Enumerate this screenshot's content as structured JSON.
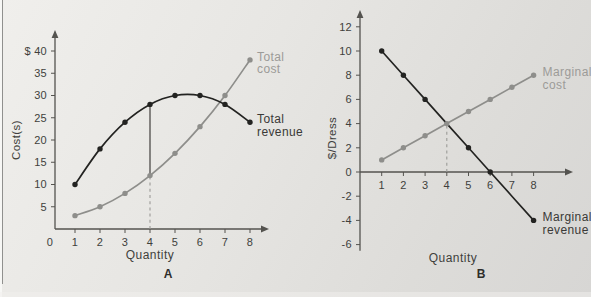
{
  "page": {
    "background_top": "#f0efec",
    "background_bottom": "#d7d6d4",
    "left_edge_line_color": "#90908e",
    "axis_color": "#54534f",
    "tick_text_color": "#403f3c"
  },
  "chart_data": [
    {
      "type": "line",
      "panel_label": "A",
      "xlabel": "Quantity",
      "ylabel": "Cost(s)",
      "x": [
        1,
        2,
        3,
        4,
        5,
        6,
        7,
        8
      ],
      "x_axis_ticks": [
        0,
        1,
        2,
        3,
        4,
        5,
        6,
        7,
        8
      ],
      "y_axis_ticks": [
        5,
        10,
        15,
        20,
        25,
        30,
        35,
        40
      ],
      "y_top_tick_label": "$ 40",
      "xlim": [
        0,
        8.6
      ],
      "ylim": [
        0,
        44
      ],
      "grid": false,
      "legend_position": "right-of-line-ends",
      "series": [
        {
          "name": "Total cost",
          "label_lines": [
            "Total",
            "cost"
          ],
          "values": [
            3,
            5,
            8,
            12,
            17,
            23,
            30,
            38
          ],
          "color": "#8e8e8b",
          "label_color": "#9c9b98",
          "smooth": true,
          "marker_skip": []
        },
        {
          "name": "Total revenue",
          "label_lines": [
            "Total",
            "revenue"
          ],
          "values": [
            10,
            18,
            24,
            28,
            30,
            30,
            28,
            24
          ],
          "color": "#232321",
          "label_color": "#3a3937",
          "smooth": true,
          "marker_skip": []
        }
      ],
      "guides": [
        {
          "x": 4,
          "y1": 12,
          "y2": 28,
          "style": "solid",
          "color": "#413f3c"
        },
        {
          "x": 4,
          "y1": 0,
          "y2": 12,
          "style": "dashed",
          "color": "#9b9a97"
        }
      ]
    },
    {
      "type": "line",
      "panel_label": "B",
      "xlabel": "Quantity",
      "ylabel": "$/Dress",
      "x": [
        1,
        2,
        3,
        4,
        5,
        6,
        7,
        8
      ],
      "x_axis_ticks": [
        1,
        2,
        3,
        4,
        5,
        6,
        7,
        8
      ],
      "y_axis_ticks": [
        -6,
        -4,
        -2,
        0,
        2,
        4,
        6,
        8,
        10,
        12
      ],
      "xlim": [
        0,
        9.7
      ],
      "ylim": [
        -6.5,
        13
      ],
      "grid": false,
      "legend_position": "right-of-line-ends",
      "series": [
        {
          "name": "Marginal cost",
          "label_lines": [
            "Marginal",
            "cost"
          ],
          "values": [
            1,
            2,
            3,
            4,
            5,
            6,
            7,
            8
          ],
          "color": "#8e8e8b",
          "label_color": "#9c9b98",
          "smooth": false,
          "marker_skip": []
        },
        {
          "name": "Marginal revenue",
          "label_lines": [
            "Marginal",
            "revenue"
          ],
          "values": [
            10,
            8,
            6,
            4,
            2,
            0,
            -2,
            -4
          ],
          "color": "#232321",
          "label_color": "#3a3937",
          "smooth": false,
          "marker_skip": [
            4,
            7
          ]
        }
      ],
      "guides": [
        {
          "x": 4,
          "y1": 0,
          "y2": 4,
          "style": "dashed",
          "color": "#9b9a97"
        }
      ]
    }
  ]
}
